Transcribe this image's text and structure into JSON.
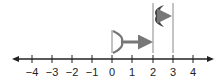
{
  "number_line": {
    "min": -4,
    "max": 4,
    "ticks": [
      "−4",
      "−3",
      "−2",
      "−1",
      "0",
      "1",
      "2",
      "3",
      "4"
    ],
    "line_color": "#222222",
    "figure_color": "#777777"
  },
  "figures": [
    {
      "name": "lower-move",
      "start": 0,
      "end": 2,
      "description": "Figure at 0 with arrow moving right to 2"
    },
    {
      "name": "upper-move",
      "start": 2,
      "end": 3,
      "description": "Figure between 2 and 3 with arrow pointing right toward 3"
    }
  ]
}
